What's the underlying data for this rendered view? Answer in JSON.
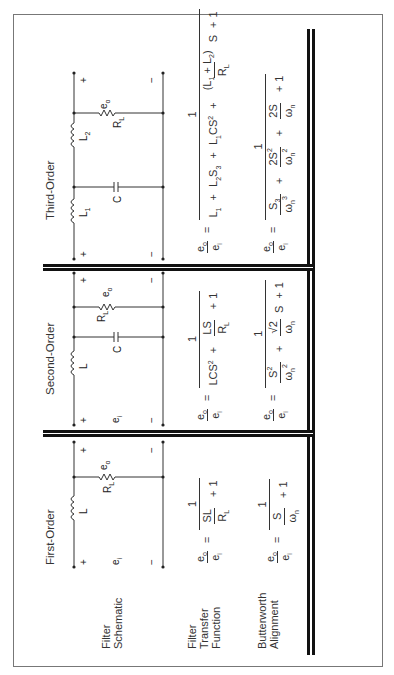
{
  "row_labels": {
    "schematic": [
      "Filter",
      "Schematic"
    ],
    "transfer": [
      "Filter",
      "Transfer",
      "Function"
    ],
    "butterworth": [
      "Butterworth",
      "Alignment"
    ]
  },
  "columns": [
    {
      "title": "First-Order",
      "schematic": {
        "components": [
          "L",
          "R_L"
        ],
        "labels": {
          "input": "e_i",
          "output": "e_o",
          "plus": "+",
          "minus": "−",
          "inductor": "L",
          "resistor": "R",
          "resistor_sub": "L",
          "ei": "e",
          "ei_sub": "i",
          "eo": "e",
          "eo_sub": "o"
        }
      },
      "transfer_function": "e_o/e_i = 1 / (SL/R_L + 1)",
      "butterworth": "e_o/e_i = 1 / (S/ω_n + 1)"
    },
    {
      "title": "Second-Order",
      "schematic": {
        "components": [
          "L",
          "C",
          "R_L"
        ],
        "labels": {
          "inductor": "L",
          "capacitor": "C",
          "resistor": "R",
          "resistor_sub": "L"
        }
      },
      "transfer_function": "e_o/e_i = 1 / (LCS^2 + LS/R_L + 1)",
      "butterworth": "e_o/e_i = 1 / (S^2/ω_n^2 + √2/ω_n S + 1)"
    },
    {
      "title": "Third-Order",
      "schematic": {
        "components": [
          "L_1",
          "C",
          "L_2",
          "R_L"
        ],
        "labels": {
          "inductor1": "L",
          "inductor1_sub": "1",
          "capacitor": "C",
          "inductor2": "L",
          "inductor2_sub": "2",
          "resistor": "R",
          "resistor_sub": "L"
        }
      },
      "transfer_function": "e_o/e_i = 1 / (L_1 + L_2S_3 + L_1CS^2 + (L_1 + L_2)/R_L S + 1)",
      "butterworth": "e_o/e_i = 1 / (S_3/ω_n^3 + 2S^2/ω_n^2 + 2S/ω_n + 1)"
    }
  ],
  "sym": {
    "e": "e",
    "o": "o",
    "i": "i",
    "eq": "=",
    "one": "1",
    "plus": "+",
    "minus": "−",
    "S": "S",
    "SL": "SL",
    "R": "R",
    "L": "L",
    "C": "C",
    "LCS": "LCS",
    "two": "2",
    "three": "3",
    "LS": "LS",
    "sqrt2": "√2",
    "omega": "ω",
    "n": "n",
    "L1": "L",
    "L2S": "L",
    "S3": "S",
    "L1CS": "L",
    "CS": "CS",
    "twoS": "2S",
    "open": "(",
    "close": ")"
  }
}
